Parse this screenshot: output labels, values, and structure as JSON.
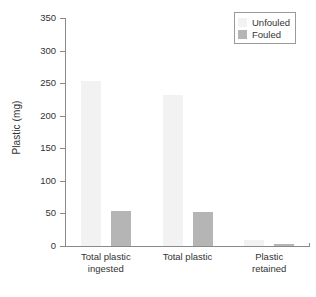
{
  "chart_data": {
    "type": "bar",
    "title": "",
    "xlabel": "",
    "ylabel": "Plastic (mg)",
    "ylim": [
      0,
      350
    ],
    "yticks": [
      0,
      50,
      100,
      150,
      200,
      250,
      300,
      350
    ],
    "ytick_labels": [
      "0",
      "50",
      "100",
      "150",
      "200",
      "250",
      "300",
      "350"
    ],
    "grid": false,
    "legend_position": "top-right",
    "categories": [
      "Total plastic\ningested",
      "Total plastic",
      "Plastic\nretained"
    ],
    "series": [
      {
        "name": "Unfouled",
        "color": "#f2f2f2",
        "values": [
          253,
          232,
          10
        ]
      },
      {
        "name": "Fouled",
        "color": "#b5b5b5",
        "values": [
          53,
          52,
          3
        ]
      }
    ]
  },
  "legend": {
    "entries": [
      {
        "label": "Unfouled"
      },
      {
        "label": "Fouled"
      }
    ]
  },
  "colors": {
    "unfouled": "#f2f2f2",
    "fouled": "#b5b5b5",
    "axis": "#8a8a8a",
    "text": "#333333",
    "background": "#ffffff"
  }
}
